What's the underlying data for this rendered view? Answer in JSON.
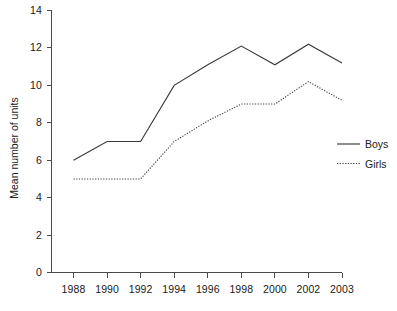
{
  "chart_data": {
    "type": "line",
    "title": "",
    "xlabel": "",
    "ylabel": "Mean number of units",
    "x": [
      "1988",
      "1990",
      "1992",
      "1994",
      "1996",
      "1998",
      "2000",
      "2002",
      "2003"
    ],
    "categories": [
      "1988",
      "1990",
      "1992",
      "1994",
      "1996",
      "1998",
      "2000",
      "2002",
      "2003"
    ],
    "series": [
      {
        "name": "Boys",
        "style": "solid",
        "values": [
          6,
          7,
          7,
          10,
          11.1,
          12.1,
          11.1,
          12.2,
          11.2
        ]
      },
      {
        "name": "Girls",
        "style": "dotted",
        "values": [
          5,
          5,
          5,
          7,
          8.1,
          9,
          9,
          10.2,
          9.2
        ]
      }
    ],
    "ylim": [
      0,
      14
    ],
    "ytick_labels": [
      "0",
      "2",
      "4",
      "6",
      "8",
      "10",
      "12",
      "14"
    ],
    "ytick_values": [
      0,
      2,
      4,
      6,
      8,
      10,
      12,
      14
    ],
    "grid": false,
    "legend_position": "right"
  },
  "axes": {
    "y_title": "Mean number of units",
    "y_ticks": [
      "14",
      "12",
      "10",
      "8",
      "6",
      "4",
      "2",
      "0"
    ],
    "x_ticks": [
      "1988",
      "1990",
      "1992",
      "1994",
      "1996",
      "1998",
      "2000",
      "2002",
      "2003"
    ]
  },
  "legend": {
    "entries": [
      {
        "label": "Boys",
        "icon": "solid-line-swatch"
      },
      {
        "label": "Girls",
        "icon": "dotted-line-swatch"
      }
    ]
  },
  "colors": {
    "axis": "#4a4a4a",
    "series": "#3a3a3a",
    "text": "#202020",
    "background": "#ffffff"
  }
}
